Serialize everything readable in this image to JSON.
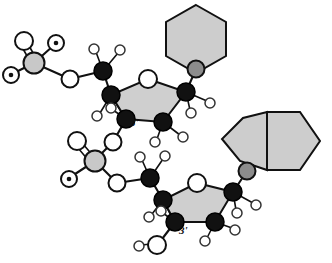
{
  "figure": {
    "type": "chemical-structure-diagram",
    "background_color": "#ffffff",
    "labels": [
      {
        "id": "top-5prime",
        "text": "5'",
        "x": 101,
        "y": 69
      },
      {
        "id": "top-3prime",
        "text": "3'",
        "x": 128,
        "y": 122
      },
      {
        "id": "bottom-5prime",
        "text": "5'",
        "x": 148,
        "y": 171
      },
      {
        "id": "bottom-3prime",
        "text": "3'",
        "x": 177,
        "y": 229
      }
    ],
    "atom_styles": {
      "carbon_fill": "#111111",
      "carbon_stroke": "#000000",
      "oxygen_fill": "#ffffff",
      "oxygen_stroke": "#111111",
      "hydrogen_fill": "#ffffff",
      "hydrogen_stroke": "#333333",
      "phosphorus_fill": "#c8c8c8",
      "phosphorus_stroke": "#111111",
      "nitrogen_fill": "#8c8c8c",
      "nitrogen_stroke": "#111111",
      "ring_fill": "#cfcfcf",
      "ring_stroke": "#111111",
      "base_fill": "#cdcdcd",
      "base_stroke": "#111111",
      "bond_color": "#111111",
      "charge_dot_fill": "#111111"
    },
    "nucleotides": [
      {
        "id": "nucleotide-top",
        "base_type": "pyrimidine-hexagon",
        "phosphate": {
          "p_label": "P",
          "oxygens": 4,
          "anionic_oxygens": 2,
          "double_bonded_oxygens": 1
        },
        "sugar": {
          "ring_atoms": 5,
          "ring_oxygen_position": "top"
        },
        "label_5prime": "5'",
        "label_3prime": "3'"
      },
      {
        "id": "nucleotide-bottom",
        "base_type": "purine-bicyclic",
        "phosphate": {
          "p_label": "P",
          "oxygens": 4,
          "anionic_oxygens": 2,
          "double_bonded_oxygens": 1
        },
        "sugar": {
          "ring_atoms": 5,
          "ring_oxygen_position": "top"
        },
        "label_5prime": "5'",
        "label_3prime": "3'",
        "terminal_hydroxyl": true
      }
    ]
  }
}
